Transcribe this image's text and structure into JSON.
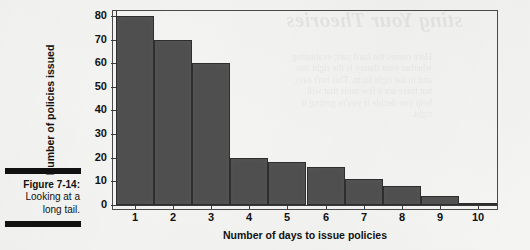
{
  "figure": {
    "caption_label": "Figure 7-14:",
    "caption_text": "Looking at a long tail."
  },
  "bleed_through": {
    "heading": "sting Your Theories",
    "body": "Here comes the hard part; evaluating\nwhether your theory is the right one\nand in the right form. This isn't easy,\nbut there are a few tools that will\nhelp you decide if you're getting it\nright."
  },
  "chart_data": {
    "type": "bar",
    "title": "",
    "xlabel": "Number of days to issue policies",
    "ylabel": "Number of policies issued",
    "categories": [
      "1",
      "2",
      "3",
      "4",
      "5",
      "6",
      "7",
      "8",
      "9",
      "10"
    ],
    "values": [
      80,
      70,
      60,
      20,
      18,
      16,
      11,
      8,
      4,
      1
    ],
    "ylim": [
      0,
      80
    ],
    "yticks": [
      0,
      10,
      20,
      30,
      40,
      50,
      60,
      70,
      80
    ],
    "ytick_labels": [
      "0",
      "10",
      "20",
      "30",
      "40",
      "50",
      "60",
      "70",
      "80"
    ],
    "grid": false,
    "legend": null,
    "bar_color": "#4f4f4f",
    "bar_edge_color": "#2e2e2e",
    "axis_color": "#3a3a3a",
    "background_color": "#f4f4f2"
  }
}
